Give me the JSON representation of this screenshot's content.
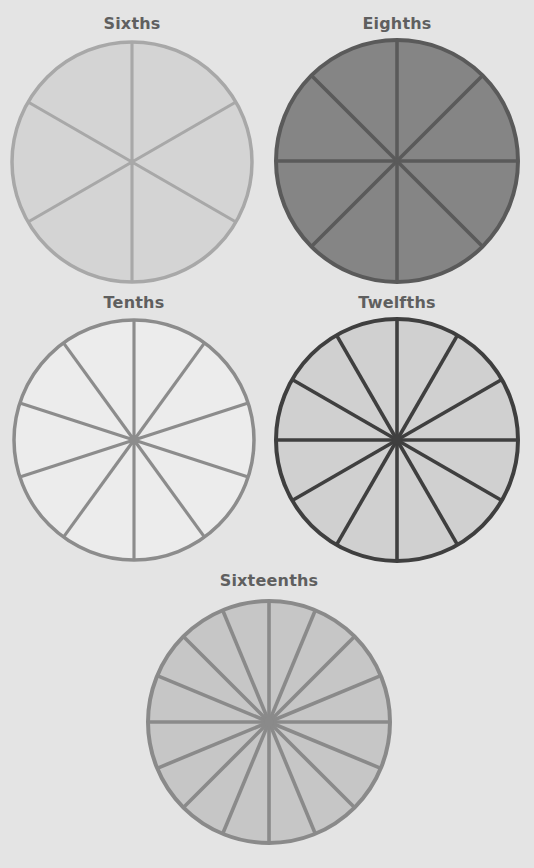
{
  "figure": {
    "background": "#e4e4e4",
    "circles": [
      {
        "label": "Sixths",
        "divisions": 6,
        "cx": 132,
        "cy": 162,
        "r": 120,
        "fill": "#d4d4d4",
        "stroke": "#a8a8a8",
        "stroke_width": 3.5,
        "offset_deg": 0,
        "title_y": 14
      },
      {
        "label": "Eighths",
        "divisions": 8,
        "cx": 397,
        "cy": 161,
        "r": 121,
        "fill": "#858585",
        "stroke": "#5a5a5a",
        "stroke_width": 4,
        "offset_deg": 0,
        "title_y": 14
      },
      {
        "label": "Tenths",
        "divisions": 10,
        "cx": 134,
        "cy": 440,
        "r": 120,
        "fill": "#ececec",
        "stroke": "#8c8c8c",
        "stroke_width": 3.5,
        "offset_deg": 0,
        "title_y": 293
      },
      {
        "label": "Twelfths",
        "divisions": 12,
        "cx": 397,
        "cy": 440,
        "r": 121,
        "fill": "#d0d0d0",
        "stroke": "#3f3f3f",
        "stroke_width": 4,
        "offset_deg": 0,
        "title_y": 293
      },
      {
        "label": "Sixteenths",
        "divisions": 16,
        "cx": 269,
        "cy": 722,
        "r": 121,
        "fill": "#c6c6c6",
        "stroke": "#8a8a8a",
        "stroke_width": 4,
        "offset_deg": 0,
        "title_y": 571
      }
    ]
  }
}
